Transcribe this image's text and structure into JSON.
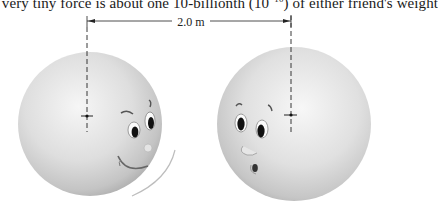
{
  "caption": {
    "text_before": "s very tiny force is about one 10-billionth (10",
    "exponent": "−10",
    "text_after": ") of either friend's weight"
  },
  "dimension": {
    "label": "2.0 m",
    "description": "center-to-center separation between the two spheres"
  },
  "figures": {
    "left_sphere": {
      "label": "left friend",
      "expression": "smiling, looking right",
      "center_marker": "cross"
    },
    "right_sphere": {
      "label": "right friend",
      "expression": "surprised, looking left",
      "center_marker": "cross"
    }
  },
  "colors": {
    "background": "#ffffff",
    "sphere_light": "#f4f4f4",
    "sphere_mid": "#d2d2d2",
    "sphere_dark": "#9a9a9a",
    "line": "#222222"
  }
}
